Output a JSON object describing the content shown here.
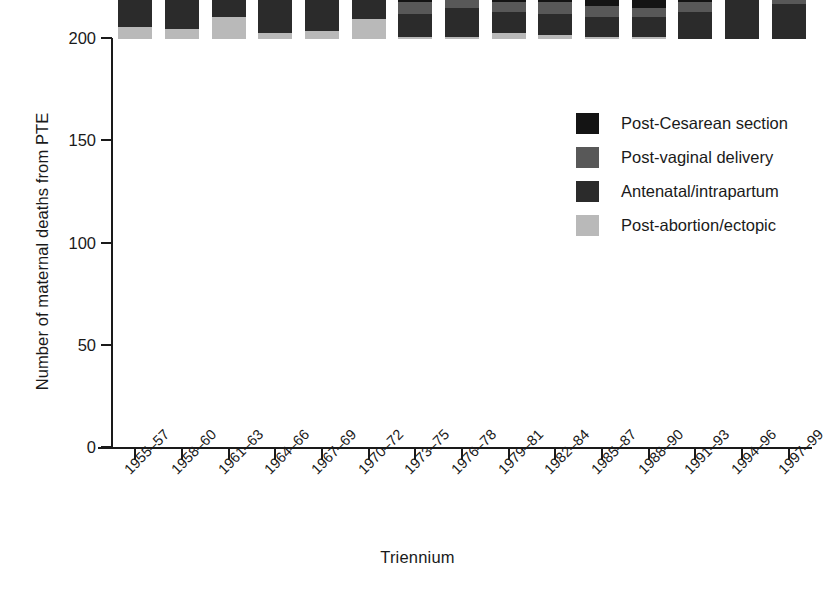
{
  "chart_data": {
    "type": "bar",
    "stacked": true,
    "title": "",
    "xlabel": "Triennium",
    "ylabel": "Number of maternal deaths from PTE",
    "ylim": [
      0,
      200
    ],
    "yticks": [
      0,
      50,
      100,
      150,
      200
    ],
    "grid": false,
    "legend_position": "top-right",
    "categories": [
      "1955–57",
      "1958–60",
      "1961–63",
      "1964–66",
      "1967–69",
      "1970–72",
      "1973–75",
      "1976–78",
      "1979–81",
      "1982–84",
      "1985–87",
      "1988–90",
      "1991–93",
      "1994–96",
      "1997–99"
    ],
    "series": [
      {
        "name": "Post-abortion/ectopic",
        "color": "#b9b9b9",
        "values": [
          6,
          5,
          11,
          3,
          4,
          10,
          1,
          1,
          3,
          2,
          1,
          1,
          0,
          0,
          0
        ]
      },
      {
        "name": "Antenatal/intrapartum",
        "color": "#2b2b2b",
        "values": [
          16,
          30,
          34,
          23,
          24,
          19,
          11,
          14,
          10,
          10,
          10,
          10,
          13,
          19,
          17
        ]
      },
      {
        "name": "Post-vaginal delivery",
        "color": "#585858",
        "values": [
          116,
          80,
          67,
          43,
          34,
          16,
          6,
          14,
          5,
          6,
          5,
          4,
          5,
          12,
          5
        ]
      },
      {
        "name": "Post-Cesarean section",
        "color": "#141414",
        "values": [
          26,
          23,
          28,
          26,
          19,
          15,
          17,
          15,
          9,
          9,
          7,
          7,
          10,
          10,
          7
        ]
      }
    ],
    "totals": [
      164,
      138,
      140,
      95,
      81,
      60,
      35,
      44,
      27,
      27,
      23,
      22,
      28,
      41,
      29
    ]
  },
  "legend": {
    "items": [
      {
        "label": "Post-Cesarean section",
        "color": "#141414"
      },
      {
        "label": "Post-vaginal delivery",
        "color": "#585858"
      },
      {
        "label": "Antenatal/intrapartum",
        "color": "#2b2b2b"
      },
      {
        "label": "Post-abortion/ectopic",
        "color": "#b9b9b9"
      }
    ]
  },
  "axes": {
    "y_title": "Number of maternal deaths from PTE",
    "x_title": "Triennium",
    "y_tick_labels": [
      "0",
      "50",
      "100",
      "150",
      "200"
    ]
  }
}
